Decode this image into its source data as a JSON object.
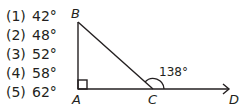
{
  "choices": [
    {
      "num": "(1)",
      "value": "42°"
    },
    {
      "num": "(2)",
      "value": "48°"
    },
    {
      "num": "(3)",
      "value": "52°"
    },
    {
      "num": "(4)",
      "value": "58°"
    },
    {
      "num": "(5)",
      "value": "62°"
    }
  ],
  "diagram": {
    "points": {
      "A": "A",
      "B": "B",
      "C": "C",
      "D": "D"
    },
    "angle_label": "138°",
    "stroke_color": "#231f20"
  }
}
